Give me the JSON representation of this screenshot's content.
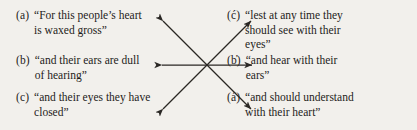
{
  "figure": {
    "type": "chiasm-diagram",
    "background_color": "#f2f0ec",
    "text_color": "#1e1c1a",
    "line_color": "#2a2724",
    "left_column": [
      {
        "label": "(a)",
        "lines": [
          "“For this people’s heart",
          "is waxed gross”"
        ]
      },
      {
        "label": "(b)",
        "lines": [
          "“and their ears are dull",
          "of hearing”"
        ]
      },
      {
        "label": "(c)",
        "lines": [
          "“and their eyes they have",
          "closed”"
        ]
      }
    ],
    "right_column": [
      {
        "label": "(ć)",
        "lines": [
          "“lest at any time they",
          "should see with their",
          "eyes”"
        ]
      },
      {
        "label": "(b̓)",
        "lines": [
          "“and hear with their",
          "ears”"
        ]
      },
      {
        "label": "(á)",
        "lines": [
          "“and should understand",
          "with their heart”"
        ]
      }
    ],
    "connectors": [
      {
        "name": "heart-to-heart",
        "from": "a",
        "to": "á",
        "double_headed": true,
        "orientation": "diagonal-down-right"
      },
      {
        "name": "ears-to-ears",
        "from": "b",
        "to": "b̓",
        "double_headed": true,
        "orientation": "horizontal"
      },
      {
        "name": "eyes-to-eyes",
        "from": "c",
        "to": "ć",
        "double_headed": true,
        "orientation": "diagonal-up-right"
      }
    ],
    "crossing_point": {
      "x": 207,
      "y": 65
    }
  }
}
